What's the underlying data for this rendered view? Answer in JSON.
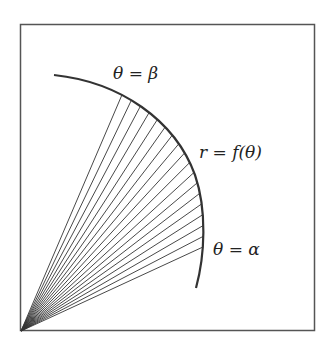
{
  "diagram": {
    "labels": {
      "beta": "θ = β",
      "curve": "r = f(θ)",
      "alpha": "θ = α"
    },
    "colors": {
      "frame": "#555555",
      "curve": "#333333",
      "spokes": "#333333",
      "background": "#ffffff"
    },
    "spoke_count": 18
  }
}
